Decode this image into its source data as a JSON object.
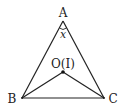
{
  "diagram": {
    "type": "geometry-triangle",
    "vertices": {
      "A": {
        "label": "A",
        "x": 63,
        "y": 21
      },
      "B": {
        "label": "B",
        "x": 22,
        "y": 98
      },
      "C": {
        "label": "C",
        "x": 104,
        "y": 98
      }
    },
    "center_point": {
      "label": "O(I)",
      "x": 63,
      "y": 72
    },
    "angle_label": "x",
    "segments": [
      "AB",
      "AC",
      "BC",
      "OB",
      "OC"
    ],
    "colors": {
      "stroke": "#222222",
      "background": "#ffffff"
    }
  }
}
